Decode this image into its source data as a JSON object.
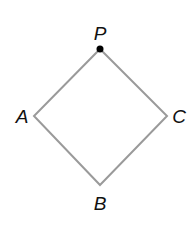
{
  "diagram": {
    "shape": "square rotated 45 degrees (rhombus)",
    "stroke_color": "#9a9a9a",
    "point_color": "#000000",
    "vertices": [
      {
        "label": "P",
        "x": 100,
        "y": 49,
        "marked": true
      },
      {
        "label": "C",
        "x": 167,
        "y": 116,
        "marked": false
      },
      {
        "label": "B",
        "x": 100,
        "y": 185,
        "marked": false
      },
      {
        "label": "A",
        "x": 34,
        "y": 116,
        "marked": false
      }
    ],
    "labels": {
      "P": "P",
      "A": "A",
      "B": "B",
      "C": "C"
    }
  }
}
